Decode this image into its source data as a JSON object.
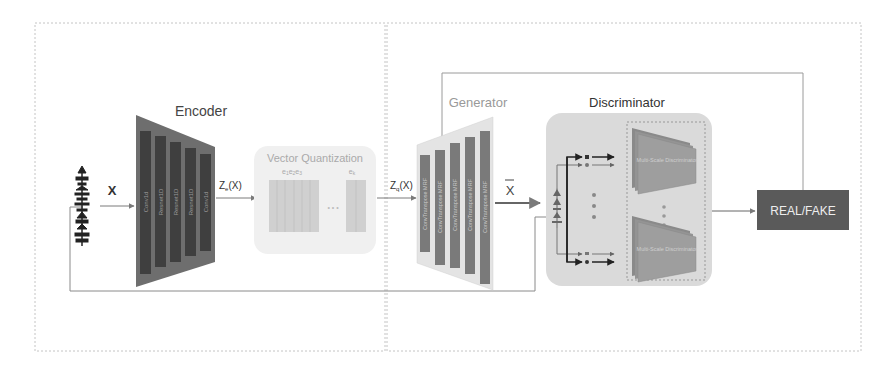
{
  "diagram": {
    "type": "architecture",
    "panels": [
      {
        "name": "left-panel"
      },
      {
        "name": "right-panel"
      }
    ],
    "input": {
      "label": "X",
      "icon": "waveform-icon"
    },
    "encoder": {
      "title": "Encoder",
      "layers": [
        "Conv1d",
        "Resnet1D",
        "Resnet1D",
        "Resnet1D",
        "Conv1d"
      ],
      "output_label": "Z",
      "output_subscript": "e",
      "output_suffix": "(X)"
    },
    "vector_quantization": {
      "title": "Vector Quantization",
      "codebook_first_label": "e",
      "codebook_first_subs": [
        "1",
        "2",
        "3"
      ],
      "codebook_last_label": "e",
      "codebook_last_sub": "k",
      "ellipsis": "• • •",
      "output_label": "Z",
      "output_subscript": "q",
      "output_suffix": "(X)"
    },
    "generator": {
      "title": "Generator",
      "layers": [
        "ConvTranspose MRF",
        "ConvTranspose MRF",
        "ConvTranspose MRF",
        "ConvTranspose MRF",
        "ConvTranspose MRF"
      ],
      "output_label": "X"
    },
    "discriminator": {
      "title": "Discriminator",
      "sub_blocks": [
        "Multi-Scale Discriminator",
        "Multi-Scale Discriminator"
      ]
    },
    "output": {
      "label": "REAL/FAKE"
    },
    "colors": {
      "encoder_bg": "#6e6e6e",
      "encoder_layer": "#3f3f3f",
      "generator_bg": "#e4e4e4",
      "generator_layer": "#7a7a7a",
      "vq_bg": "#f0f0f0",
      "vq_codebook": "#cfcfcf",
      "disc_bg": "#dadada",
      "disc_block": "#9a9a9a",
      "realfake_bg": "#5a5a5a",
      "line": "#8a8a8a",
      "dashed": "#bdbdbd"
    }
  }
}
